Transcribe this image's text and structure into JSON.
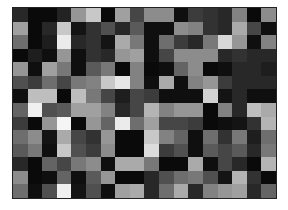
{
  "chart_data": {
    "type": "heatmap",
    "title": "",
    "xlabel": "",
    "ylabel": "",
    "colormap": "grayscale",
    "value_range": [
      0,
      255
    ],
    "n_rows": 14,
    "n_cols": 18,
    "grid": false,
    "legend": "none",
    "values": [
      [
        40,
        10,
        10,
        35,
        150,
        200,
        10,
        160,
        70,
        140,
        140,
        15,
        60,
        50,
        40,
        130,
        10,
        140
      ],
      [
        160,
        10,
        40,
        200,
        20,
        50,
        80,
        40,
        90,
        15,
        15,
        140,
        130,
        50,
        40,
        170,
        70,
        15
      ],
      [
        110,
        10,
        30,
        235,
        40,
        50,
        20,
        170,
        120,
        15,
        110,
        60,
        40,
        120,
        215,
        150,
        15,
        130
      ],
      [
        10,
        30,
        15,
        150,
        15,
        50,
        40,
        150,
        160,
        15,
        70,
        140,
        140,
        140,
        40,
        50,
        40,
        40
      ],
      [
        150,
        15,
        160,
        120,
        15,
        90,
        120,
        10,
        130,
        10,
        15,
        100,
        140,
        10,
        15,
        40,
        40,
        30
      ],
      [
        80,
        60,
        110,
        70,
        120,
        130,
        200,
        230,
        130,
        15,
        170,
        15,
        130,
        150,
        60,
        40,
        40,
        40
      ],
      [
        15,
        190,
        190,
        10,
        190,
        120,
        70,
        30,
        70,
        60,
        15,
        15,
        15,
        210,
        20,
        40,
        15,
        15
      ],
      [
        100,
        240,
        80,
        90,
        160,
        160,
        130,
        40,
        70,
        180,
        130,
        150,
        150,
        10,
        130,
        40,
        190,
        170
      ],
      [
        60,
        10,
        150,
        245,
        10,
        150,
        100,
        235,
        110,
        160,
        70,
        70,
        60,
        10,
        15,
        20,
        50,
        180
      ],
      [
        110,
        140,
        20,
        170,
        70,
        50,
        150,
        10,
        10,
        200,
        130,
        100,
        15,
        110,
        50,
        120,
        30,
        110
      ],
      [
        90,
        120,
        15,
        200,
        80,
        60,
        140,
        10,
        10,
        220,
        60,
        80,
        15,
        90,
        70,
        90,
        40,
        120
      ],
      [
        40,
        10,
        100,
        70,
        120,
        140,
        15,
        170,
        170,
        120,
        10,
        10,
        170,
        15,
        70,
        40,
        10,
        180
      ],
      [
        140,
        10,
        15,
        100,
        15,
        90,
        150,
        10,
        10,
        40,
        80,
        110,
        120,
        80,
        20,
        180,
        50,
        10
      ],
      [
        110,
        15,
        80,
        240,
        20,
        80,
        15,
        160,
        170,
        40,
        110,
        170,
        40,
        130,
        150,
        160,
        40,
        100
      ]
    ]
  },
  "frame": {
    "border_color": "#222222",
    "background": "#ffffff"
  }
}
